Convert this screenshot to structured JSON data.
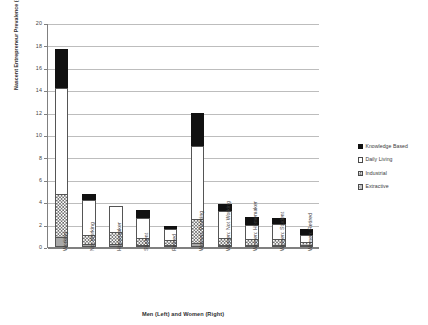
{
  "chart_data": {
    "type": "bar",
    "stacked": true,
    "title": "",
    "xlabel": "Men (Left) and Women (Right)",
    "ylabel": "Nascent Entrepreneur Prevalence (#/100 Adults)",
    "ylim": [
      0,
      20
    ],
    "ytick_values": [
      0,
      2,
      4,
      6,
      8,
      10,
      12,
      14,
      16,
      18,
      20
    ],
    "ytick_labels": [
      "0",
      "2",
      "4",
      "6",
      "8",
      "10",
      "12",
      "14",
      "16",
      "18",
      "20"
    ],
    "grid": true,
    "legend_position": "right",
    "categories": [
      "Working",
      "Not Working",
      "Homemaker",
      "Student",
      "Retired",
      "Women: Working",
      "Women: Not Working",
      "Women: Homemaker",
      "Women: Student",
      "Women: Retired"
    ],
    "series": [
      {
        "name": "Extractive",
        "fill": "gray-solid",
        "color": "#a8a8a8",
        "values": [
          0.9,
          0.3,
          0.3,
          0.2,
          0.2,
          0.4,
          0.15,
          0.15,
          0.15,
          0.1
        ]
      },
      {
        "name": "Industrial",
        "fill": "checkerboard",
        "color": "#6f6f6f",
        "values": [
          3.8,
          0.8,
          1.0,
          0.6,
          0.4,
          2.1,
          0.6,
          0.5,
          0.5,
          0.3
        ]
      },
      {
        "name": "Daily Living",
        "fill": "white",
        "color": "#ffffff",
        "values": [
          9.5,
          3.1,
          2.4,
          1.8,
          1.0,
          6.5,
          2.4,
          1.3,
          1.4,
          0.6
        ]
      },
      {
        "name": "Knowledge Based",
        "fill": "black-solid",
        "color": "#111111",
        "values": [
          3.5,
          0.5,
          0.0,
          0.7,
          0.3,
          3.0,
          0.7,
          0.7,
          0.5,
          0.5
        ]
      }
    ],
    "totals": [
      17.7,
      4.7,
      3.7,
      3.3,
      1.9,
      12.0,
      3.85,
      2.65,
      2.55,
      1.5
    ]
  },
  "legend": {
    "items": [
      {
        "label": "Knowledge Based",
        "fill": "black-solid"
      },
      {
        "label": "Daily Living",
        "fill": "white"
      },
      {
        "label": "Industrial",
        "fill": "checkerboard"
      },
      {
        "label": "Extractive",
        "fill": "checkerboard-fine"
      }
    ]
  }
}
